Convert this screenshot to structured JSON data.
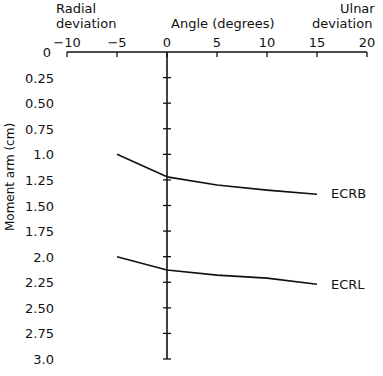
{
  "chart_data": {
    "type": "line",
    "title": "",
    "xlabel": "Angle (degrees)",
    "ylabel": "Moment arm (cm)",
    "x_left_annotation": "Radial deviation",
    "x_right_annotation": "Ulnar deviation",
    "xlim": [
      -10,
      20
    ],
    "ylim": [
      0,
      3.0
    ],
    "y_inverted": true,
    "x_axis_position": "top",
    "grid": false,
    "x_ticks": [
      "-10",
      "-5",
      "0",
      "5",
      "10",
      "15",
      "20"
    ],
    "y_ticks": [
      "0",
      "0.25",
      "0.50",
      "0.75",
      "1.0",
      "1.25",
      "1.50",
      "1.75",
      "2.0",
      "2.25",
      "2.50",
      "2.75",
      "3.0"
    ],
    "x": [
      -5,
      0,
      5,
      10,
      15
    ],
    "series": [
      {
        "name": "ECRB",
        "values": [
          1.0,
          1.22,
          1.3,
          1.35,
          1.39
        ]
      },
      {
        "name": "ECRL",
        "values": [
          2.0,
          2.13,
          2.18,
          2.21,
          2.27
        ]
      }
    ]
  },
  "labels": {
    "radial_line1": "Radial",
    "radial_line2": "deviation",
    "ulnar_line1": "Ulnar",
    "ulnar_line2": "deviation",
    "xlabel": "Angle (degrees)",
    "ylabel": "Moment arm (cm)",
    "ecrb": "ECRB",
    "ecrl": "ECRL"
  }
}
